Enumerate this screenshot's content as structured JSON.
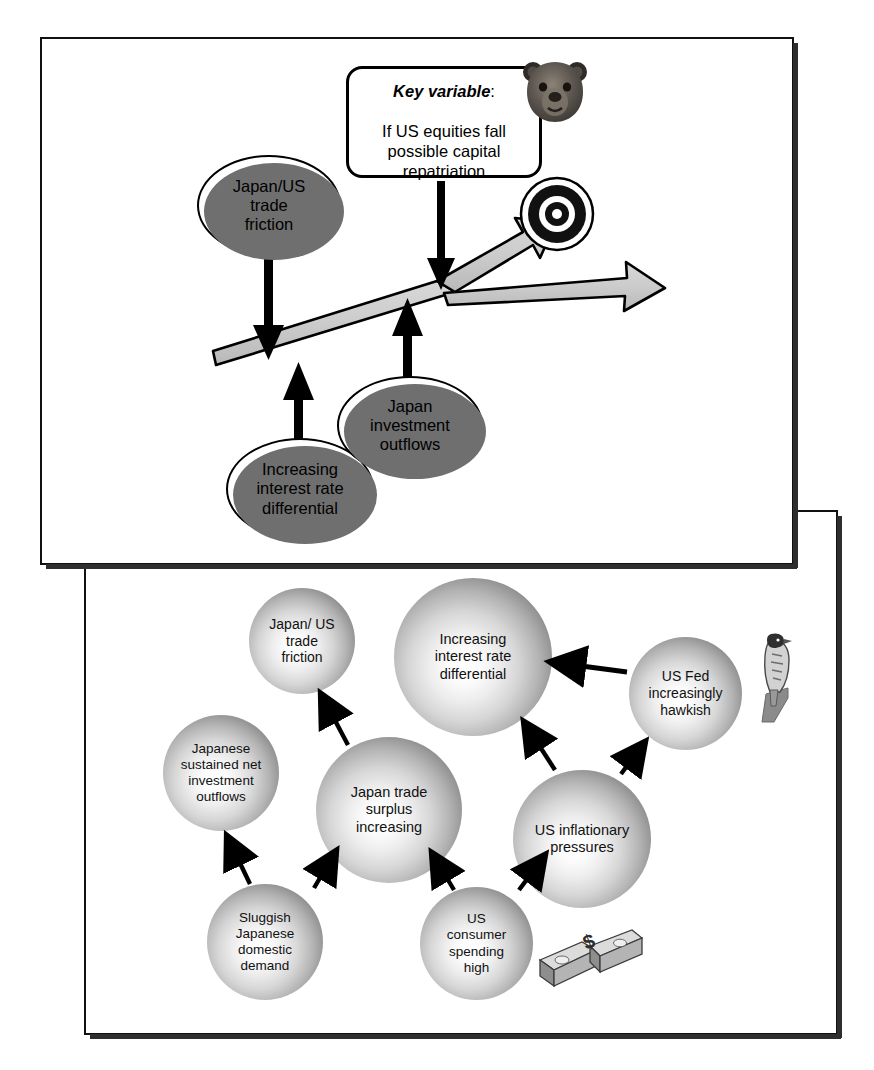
{
  "diagram": {
    "title_visible": false,
    "panels": [
      {
        "name": "usd-jpy-outlook-panel"
      },
      {
        "name": "drivers-causal-map-panel"
      }
    ]
  },
  "top_panel": {
    "axis_label": "USD/JPY",
    "key_variable": {
      "heading": "Key variable",
      "heading_suffix": ":",
      "body": "If US equities fall\npossible capital\nrepatriation"
    },
    "targets": [
      {
        "name": "six-month-target",
        "label": "6 month target",
        "value": "$1=¥130"
      },
      {
        "name": "equities-fall-target",
        "label": "Target if\nUS equities fall",
        "value": "$1=¥115"
      }
    ],
    "drivers": [
      {
        "name": "japan-us-trade-friction",
        "label": "Japan/US\ntrade\nfriction",
        "arrow": "down"
      },
      {
        "name": "increasing-interest-rate-differential",
        "label": "Increasing\ninterest rate\ndifferential",
        "arrow": "up"
      },
      {
        "name": "japan-investment-outflows",
        "label": "Japan\ninvestment\noutflows",
        "arrow": "up"
      }
    ],
    "icons": [
      {
        "name": "bear-icon",
        "meaning": "bearish"
      },
      {
        "name": "bullseye-target-icon",
        "meaning": "price target"
      }
    ]
  },
  "bottom_panel": {
    "nodes": [
      {
        "id": "japan-us-trade-friction",
        "label": "Japan/ US\ntrade\nfriction"
      },
      {
        "id": "increasing-interest-rate-differential",
        "label": "Increasing\ninterest rate\ndifferential"
      },
      {
        "id": "japanese-sustained-net-investment-outflows",
        "label": "Japanese\nsustained net\ninvestment\noutflows"
      },
      {
        "id": "japan-trade-surplus-increasing",
        "label": "Japan trade\nsurplus\nincreasing"
      },
      {
        "id": "us-fed-increasingly-hawkish",
        "label": "US Fed\nincreasingly\nhawkish"
      },
      {
        "id": "us-inflationary-pressures",
        "label": "US inflationary\npressures"
      },
      {
        "id": "sluggish-japanese-domestic-demand",
        "label": "Sluggish\nJapanese\ndomestic\ndemand"
      },
      {
        "id": "us-consumer-spending-high",
        "label": "US\nconsumer\nspending\nhigh"
      }
    ],
    "edges": [
      {
        "from": "japan-trade-surplus-increasing",
        "to": "japan-us-trade-friction"
      },
      {
        "from": "sluggish-japanese-domestic-demand",
        "to": "japanese-sustained-net-investment-outflows"
      },
      {
        "from": "sluggish-japanese-domestic-demand",
        "to": "japan-trade-surplus-increasing"
      },
      {
        "from": "us-consumer-spending-high",
        "to": "japan-trade-surplus-increasing"
      },
      {
        "from": "us-consumer-spending-high",
        "to": "us-inflationary-pressures"
      },
      {
        "from": "us-inflationary-pressures",
        "to": "increasing-interest-rate-differential"
      },
      {
        "from": "us-inflationary-pressures",
        "to": "us-fed-increasingly-hawkish"
      },
      {
        "from": "us-fed-increasingly-hawkish",
        "to": "increasing-interest-rate-differential"
      }
    ],
    "icons": [
      {
        "name": "hawk-icon",
        "meaning": "hawkish fed"
      },
      {
        "name": "dollar-bills-icon",
        "meaning": "consumer spending"
      }
    ]
  },
  "colors": {
    "outline": "#000000",
    "panel_shadow": "#2e2e2e",
    "ribbon_fill": "#c9c9c9",
    "ellipse_shadow": "#6f6f6f",
    "sphere_light": "#ffffff",
    "sphere_dark": "#4a4a4a"
  }
}
